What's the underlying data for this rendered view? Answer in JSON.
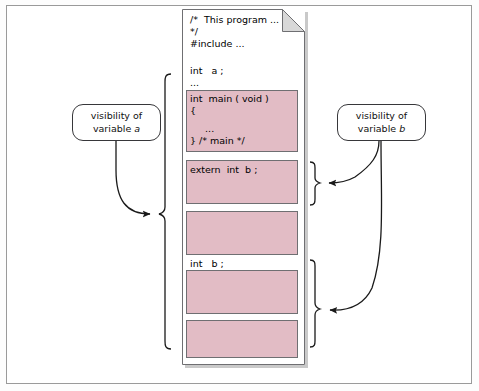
{
  "figure": {
    "background_color": "#ffffff",
    "frame_color": "#9a9a9a"
  },
  "colors": {
    "code_block_fill": "#e2bcc5",
    "code_block_border": "#6f6f72",
    "page_border": "#6f6f72",
    "page_shadow": "#c9c9c9",
    "line": "#1a1a1a",
    "text": "#000000"
  },
  "page": {
    "name": "c-source-file",
    "folded_corner": true,
    "lines": [
      {
        "id": "comment-open",
        "text": "/*  This program ..."
      },
      {
        "id": "comment-close",
        "text": "*/"
      },
      {
        "id": "include",
        "text": "#include ..."
      },
      {
        "id": "decl-a",
        "text": "int   a ;"
      },
      {
        "id": "ellipsis-1",
        "text": "..."
      },
      {
        "id": "decl-b",
        "text": "int   b ;"
      }
    ]
  },
  "code_blocks": [
    {
      "id": "main-function",
      "lines": [
        "int  main ( void )",
        "{",
        "     ...",
        "} /* main */"
      ]
    },
    {
      "id": "extern-b-function",
      "lines": [
        "extern  int  b ;"
      ]
    },
    {
      "id": "function-3",
      "lines": []
    },
    {
      "id": "function-4",
      "lines": []
    },
    {
      "id": "function-5",
      "lines": []
    }
  ],
  "callouts": [
    {
      "id": "visibility-a",
      "line1": "visibility of",
      "line2_prefix": "variable",
      "line2_var": "a"
    },
    {
      "id": "visibility-b",
      "line1": "visibility of",
      "line2_prefix": "variable",
      "line2_var": "b"
    }
  ],
  "braces": [
    {
      "id": "brace-a",
      "side": "left",
      "label_ref": "visibility-a",
      "spans": "entire file from int a to end"
    },
    {
      "id": "brace-b-extern",
      "side": "right",
      "label_ref": "visibility-b",
      "spans": "extern int b block"
    },
    {
      "id": "brace-b-global",
      "side": "right",
      "label_ref": "visibility-b",
      "spans": "int b declaration to end of file"
    }
  ]
}
